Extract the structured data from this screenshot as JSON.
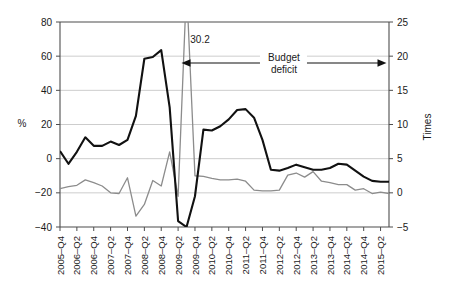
{
  "chart_data": {
    "type": "line",
    "title": "",
    "xlabel": "",
    "ylabel": "%",
    "y2label": "Times",
    "ylim": [
      -40,
      80
    ],
    "y2lim": [
      -5,
      25
    ],
    "yticks": [
      "80",
      "60",
      "40",
      "20",
      "0",
      "-20",
      "-40"
    ],
    "ytick_values": [
      80,
      60,
      40,
      20,
      0,
      -20,
      -40
    ],
    "y2ticks": [
      "25",
      "20",
      "15",
      "10",
      "5",
      "0",
      "-5"
    ],
    "y2tick_values": [
      25,
      20,
      15,
      10,
      5,
      0,
      -5
    ],
    "grid": true,
    "legend": "none",
    "categories": [
      "2005–Q4",
      "2006–Q1",
      "2006–Q2",
      "2006–Q3",
      "2006–Q4",
      "2007–Q1",
      "2007–Q2",
      "2007–Q3",
      "2007–Q4",
      "2008–Q1",
      "2008–Q2",
      "2008–Q3",
      "2008–Q4",
      "2009–Q1",
      "2009–Q2",
      "2009–Q3",
      "2009–Q4",
      "2010–Q1",
      "2010–Q2",
      "2010–Q3",
      "2010–Q4",
      "2011–Q1",
      "2011–Q2",
      "2011–Q3",
      "2011–Q4",
      "2012–Q1",
      "2012–Q2",
      "2012–Q3",
      "2012–Q4",
      "2013–Q1",
      "2013–Q2",
      "2013–Q3",
      "2013–Q4",
      "2014–Q1",
      "2014–Q2",
      "2014–Q3",
      "2014–Q4",
      "2015–Q1",
      "2015–Q2",
      "2015–Q3"
    ],
    "xtick_labels": [
      "2005–Q4",
      "2006–Q2",
      "2006–Q4",
      "2007–Q2",
      "2007–Q4",
      "2008–Q2",
      "2008–Q4",
      "2009–Q2",
      "2009–Q4",
      "2010–Q2",
      "2010–Q4",
      "2011–Q2",
      "2011–Q4",
      "2012–Q2",
      "2012–Q4",
      "2013–Q2",
      "2013–Q4",
      "2014–Q2",
      "2014–Q4",
      "2015–Q2"
    ],
    "xtick_indices": [
      0,
      2,
      4,
      6,
      8,
      10,
      12,
      14,
      16,
      18,
      20,
      22,
      24,
      26,
      28,
      30,
      32,
      34,
      36,
      38
    ],
    "series": [
      {
        "name": "black-series",
        "axis": "left",
        "color": "#111111",
        "values": [
          4.5,
          -3.0,
          4.0,
          12.5,
          7.5,
          7.5,
          10.0,
          8.0,
          11.0,
          25.0,
          58.5,
          59.5,
          63.5,
          30.0,
          -36.5,
          -40.0,
          -22.0,
          17.0,
          16.5,
          19.0,
          23.0,
          28.5,
          29.0,
          24.0,
          11.0,
          -6.5,
          -7.0,
          -5.5,
          -3.5,
          -5.0,
          -6.5,
          -6.5,
          -5.5,
          -3.0,
          -3.5,
          -7.0,
          -10.5,
          -13.0,
          -13.5,
          -13.5
        ]
      },
      {
        "name": "gray-series",
        "axis": "right",
        "color": "#8c8c8c",
        "values": [
          0.6,
          0.9,
          1.1,
          1.9,
          1.5,
          1.0,
          0.0,
          -0.1,
          2.2,
          -3.4,
          -1.7,
          1.8,
          1.0,
          6.0,
          -0.5,
          30.2,
          2.5,
          2.4,
          2.1,
          1.9,
          1.9,
          2.0,
          1.7,
          0.4,
          0.3,
          0.3,
          0.4,
          2.6,
          2.9,
          2.3,
          3.1,
          1.7,
          1.5,
          1.2,
          1.2,
          0.4,
          0.6,
          -0.1,
          0.1,
          -0.1
        ]
      }
    ],
    "annotations": [
      {
        "name": "peak-value-label",
        "text": "30.2",
        "x_index": 16.6,
        "y_value": 70
      },
      {
        "name": "budget-deficit-label",
        "line1": "Budget",
        "line2": "deficit"
      }
    ],
    "arrow": {
      "name": "budget-deficit-arrow",
      "label_line1": "Budget",
      "label_line2": "deficit",
      "start_index": 14.4,
      "end_index": 38.7,
      "y_value": 56
    },
    "clip_note": "gray series peak is clipped at top of plot area"
  }
}
